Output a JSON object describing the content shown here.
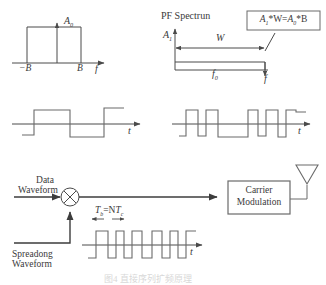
{
  "figure": {
    "title_caption": "图4 直接序列扩频原理",
    "caption_visible": false
  },
  "panel_baseband_spectrum": {
    "amplitude_label": "A",
    "amplitude_sub": "0",
    "left_tick": "−B",
    "right_tick": "B",
    "axis_label": "f",
    "shape": "rectangle"
  },
  "panel_spread_spectrum": {
    "title": "PF Spectrun",
    "amplitude_label": "A",
    "amplitude_sub": "1",
    "width_label": "W",
    "center_freq_label": "f",
    "center_freq_sub": "0",
    "axis_label": "f",
    "callout": {
      "a1": "A",
      "a1_sub": "1",
      "op1": "*W=",
      "a0": "A",
      "a0_sub": "0",
      "op2": "*B",
      "full_text": "A1*W=A0*B"
    }
  },
  "panel_data_waveform": {
    "axis_label": "t",
    "type": "square-wave",
    "bit_pattern": [
      -1,
      1,
      -1,
      1
    ]
  },
  "panel_chip_waveform": {
    "axis_label": "t",
    "type": "chip-sequence",
    "chip_pattern": [
      -1,
      1,
      -1,
      1,
      -1,
      -1,
      1,
      -1,
      1,
      1,
      -1,
      1
    ]
  },
  "block_diagram": {
    "data_input_line1": "Data",
    "data_input_line2": "Waveform",
    "spreading_input_line1": "Spreadong",
    "spreading_input_line2": "Waveform",
    "multiplier_symbol": "⊗",
    "carrier_block_line1": "Carrier",
    "carrier_block_line2": "Modulation",
    "antenna": "antenna"
  },
  "panel_spread_output": {
    "timing_label_t": "T",
    "timing_label_t_sub": "b",
    "timing_label_eq": "=N",
    "timing_label_tc": "T",
    "timing_label_tc_sub": "c",
    "timing_full": "Tb=NTc",
    "axis_label": "t",
    "chip_pattern": [
      -1,
      1,
      -1,
      1,
      -1,
      -1,
      1,
      -1,
      1,
      1,
      -1,
      1
    ]
  },
  "style": {
    "stroke": "#4a4a4a",
    "text": "#3a3a3a",
    "bg": "#ffffff"
  }
}
